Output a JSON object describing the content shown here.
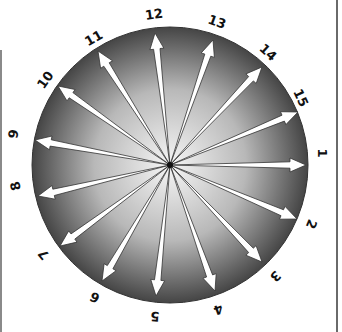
{
  "diagram": {
    "type": "radial-arrow-wheel",
    "center": [
      170,
      165
    ],
    "radius": 138,
    "colors": {
      "disc_outer": "#4a4a4a",
      "disc_inner": "#f4f4f4",
      "arrow_fill": "#ffffff",
      "arrow_stroke": "#333333"
    },
    "spokes": [
      {
        "label": "12",
        "tip": [
          155,
          33
        ],
        "label_pos": [
          153,
          15
        ],
        "rot": -8
      },
      {
        "label": "13",
        "tip": [
          213,
          40
        ],
        "label_pos": [
          216,
          22
        ],
        "rot": 20
      },
      {
        "label": "14",
        "tip": [
          262,
          67
        ],
        "label_pos": [
          267,
          52
        ],
        "rot": 42
      },
      {
        "label": "15",
        "tip": [
          298,
          112
        ],
        "label_pos": [
          300,
          97
        ],
        "rot": 65
      },
      {
        "label": "1",
        "tip": [
          306,
          165
        ],
        "label_pos": [
          322,
          153
        ],
        "rot": 90
      },
      {
        "label": "2",
        "tip": [
          297,
          219
        ],
        "label_pos": [
          311,
          224
        ],
        "rot": 112
      },
      {
        "label": "3",
        "tip": [
          262,
          262
        ],
        "label_pos": [
          275,
          276
        ],
        "rot": 135
      },
      {
        "label": "4",
        "tip": [
          215,
          291
        ],
        "label_pos": [
          218,
          309
        ],
        "rot": 160
      },
      {
        "label": "5",
        "tip": [
          156,
          296
        ],
        "label_pos": [
          155,
          316
        ],
        "rot": 183
      },
      {
        "label": "6",
        "tip": [
          102,
          281
        ],
        "label_pos": [
          95,
          297
        ],
        "rot": 205
      },
      {
        "label": "7",
        "tip": [
          60,
          246
        ],
        "label_pos": [
          44,
          254
        ],
        "rot": 230
      },
      {
        "label": "8",
        "tip": [
          38,
          196
        ],
        "label_pos": [
          16,
          186
        ],
        "rot": 255
      },
      {
        "label": "9",
        "tip": [
          35,
          140
        ],
        "label_pos": [
          14,
          134
        ],
        "rot": 278
      },
      {
        "label": "10",
        "tip": [
          58,
          86
        ],
        "label_pos": [
          45,
          81
        ],
        "rot": 305
      },
      {
        "label": "11",
        "tip": [
          98,
          51
        ],
        "label_pos": [
          93,
          39
        ],
        "rot": 330
      }
    ]
  }
}
